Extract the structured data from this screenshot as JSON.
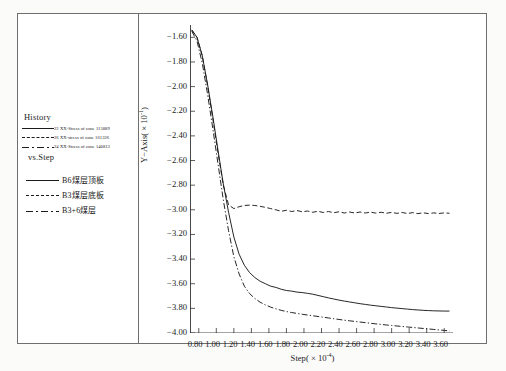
{
  "chart_data": {
    "type": "line",
    "title": "",
    "xlabel": "Step( × 10⁻⁴)",
    "ylabel": "Y−Axis( × 10⁻¹)",
    "xlim": [
      0.7,
      3.7
    ],
    "ylim": [
      -4.0,
      -1.5
    ],
    "xticks": [
      "0.80",
      "1.00",
      "1.20",
      "1.40",
      "1.60",
      "1.80",
      "2.00",
      "2.20",
      "2.40",
      "2.60",
      "2.80",
      "3.00",
      "3.20",
      "3.40",
      "3.60"
    ],
    "yticks": [
      "-1.60",
      "-1.80",
      "-2.00",
      "-2.20",
      "-2.40",
      "-2.60",
      "-2.80",
      "-3.00",
      "-3.20",
      "-3.40",
      "-3.60",
      "-3.80",
      "-4.00"
    ],
    "grid": false,
    "legend_position": "left-outside",
    "series": [
      {
        "name": "B6煤层顶板",
        "style": "solid",
        "history_label": "22  XX-Stress of  zone  115889",
        "x": [
          0.72,
          0.78,
          0.84,
          0.9,
          0.96,
          1.02,
          1.08,
          1.14,
          1.2,
          1.26,
          1.32,
          1.38,
          1.44,
          1.5,
          1.56,
          1.62,
          1.68,
          1.74,
          1.8,
          1.86,
          1.92,
          1.98,
          2.04,
          2.1,
          2.16,
          2.22,
          2.28,
          2.34,
          2.4,
          2.46,
          2.52,
          2.58,
          2.64,
          2.7,
          2.76,
          2.82,
          2.88,
          2.94,
          3.0,
          3.06,
          3.12,
          3.18,
          3.24,
          3.3,
          3.36,
          3.42,
          3.48,
          3.54,
          3.6,
          3.66
        ],
        "y": [
          -1.54,
          -1.6,
          -1.75,
          -1.98,
          -2.24,
          -2.52,
          -2.79,
          -3.02,
          -3.22,
          -3.36,
          -3.45,
          -3.51,
          -3.55,
          -3.58,
          -3.6,
          -3.62,
          -3.63,
          -3.645,
          -3.655,
          -3.66,
          -3.668,
          -3.672,
          -3.678,
          -3.685,
          -3.695,
          -3.705,
          -3.715,
          -3.724,
          -3.733,
          -3.741,
          -3.748,
          -3.755,
          -3.762,
          -3.768,
          -3.774,
          -3.779,
          -3.784,
          -3.789,
          -3.794,
          -3.798,
          -3.802,
          -3.806,
          -3.81,
          -3.813,
          -3.816,
          -3.818,
          -3.82,
          -3.821,
          -3.822,
          -3.822
        ]
      },
      {
        "name": "B3煤层底板",
        "style": "dashed",
        "history_label": "26  XX-stress of  zone  161326",
        "x": [
          0.72,
          0.78,
          0.84,
          0.9,
          0.96,
          1.02,
          1.08,
          1.14,
          1.2,
          1.26,
          1.32,
          1.38,
          1.44,
          1.5,
          1.56,
          1.62,
          1.68,
          1.74,
          1.8,
          1.86,
          1.92,
          1.98,
          2.04,
          2.1,
          2.16,
          2.22,
          2.28,
          2.34,
          2.4,
          2.46,
          2.52,
          2.58,
          2.64,
          2.7,
          2.76,
          2.82,
          2.88,
          2.94,
          3.0,
          3.06,
          3.12,
          3.18,
          3.24,
          3.3,
          3.36,
          3.42,
          3.48,
          3.54,
          3.6,
          3.66
        ],
        "y": [
          -1.54,
          -1.6,
          -1.75,
          -1.99,
          -2.26,
          -2.54,
          -2.8,
          -2.96,
          -2.99,
          -2.975,
          -2.965,
          -2.962,
          -2.965,
          -2.972,
          -2.98,
          -2.99,
          -3.0,
          -3.012,
          -3.004,
          -3.014,
          -3.006,
          -3.016,
          -3.01,
          -3.02,
          -3.012,
          -3.022,
          -3.014,
          -3.024,
          -3.016,
          -3.026,
          -3.018,
          -3.026,
          -3.018,
          -3.026,
          -3.019,
          -3.027,
          -3.02,
          -3.028,
          -3.021,
          -3.029,
          -3.022,
          -3.03,
          -3.023,
          -3.031,
          -3.024,
          -3.031,
          -3.025,
          -3.03,
          -3.025,
          -3.028
        ]
      },
      {
        "name": "B3+6煤层",
        "style": "dashdot",
        "history_label": "24  XX-Stress of  zone  140813",
        "x": [
          0.72,
          0.78,
          0.84,
          0.9,
          0.96,
          1.02,
          1.08,
          1.14,
          1.2,
          1.26,
          1.32,
          1.38,
          1.44,
          1.5,
          1.56,
          1.62,
          1.68,
          1.74,
          1.8,
          1.86,
          1.92,
          1.98,
          2.04,
          2.1,
          2.16,
          2.22,
          2.28,
          2.34,
          2.4,
          2.46,
          2.52,
          2.58,
          2.64,
          2.7,
          2.76,
          2.82,
          2.88,
          2.94,
          3.0,
          3.06,
          3.12,
          3.18,
          3.24,
          3.3,
          3.36,
          3.42,
          3.48,
          3.54,
          3.6,
          3.66
        ],
        "y": [
          -1.55,
          -1.63,
          -1.81,
          -2.06,
          -2.34,
          -2.63,
          -2.92,
          -3.17,
          -3.38,
          -3.52,
          -3.62,
          -3.68,
          -3.72,
          -3.75,
          -3.772,
          -3.79,
          -3.804,
          -3.816,
          -3.826,
          -3.834,
          -3.841,
          -3.848,
          -3.854,
          -3.86,
          -3.866,
          -3.872,
          -3.878,
          -3.884,
          -3.89,
          -3.896,
          -3.901,
          -3.906,
          -3.911,
          -3.916,
          -3.921,
          -3.926,
          -3.93,
          -3.935,
          -3.939,
          -3.943,
          -3.947,
          -3.951,
          -3.955,
          -3.959,
          -3.963,
          -3.967,
          -3.971,
          -3.975,
          -3.979,
          -3.983
        ]
      }
    ]
  },
  "legend": {
    "history_title": "History",
    "vs_step": "vs.Step",
    "history_entries": [
      {
        "label": "22  XX-Stress of  zone  115889",
        "style": "solid"
      },
      {
        "label": "26  XX-stress of  zone  161326",
        "style": "dashed"
      },
      {
        "label": "24  XX-Stress of  zone  140813",
        "style": "dashdot"
      }
    ],
    "series_entries": [
      {
        "label": "B6煤层顶板",
        "style": "solid"
      },
      {
        "label": "B3煤层底板",
        "style": "dashed"
      },
      {
        "label": "B3+6煤层",
        "style": "dashdot"
      }
    ]
  },
  "axes": {
    "y_title_main": "Y−Axis( × 10",
    "y_title_exp": "-1",
    "y_title_tail": ")",
    "x_title_main": "Step( × 10",
    "x_title_exp": "-4",
    "x_title_tail": ")"
  },
  "colors": {
    "line": "#1a1a1a",
    "frame": "#6f6f6f",
    "background": "#ffffff",
    "page": "#fbfbfa"
  }
}
